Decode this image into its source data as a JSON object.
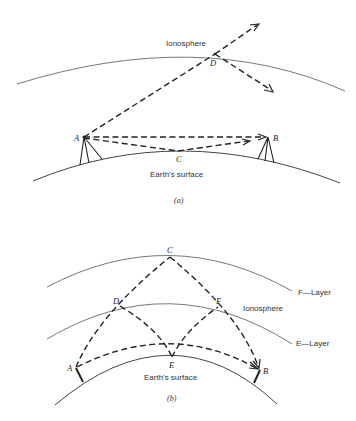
{
  "diagram_a": {
    "caption": "(a)",
    "layers": {
      "ionosphere": "Ionosphere",
      "earth": "Earth's surface"
    },
    "points": {
      "A": "A",
      "B": "B",
      "C": "C",
      "D": "D"
    },
    "description": "Sky wave penetrating the ionosphere at D vs. direct and ground-reflected waves from A to B via C"
  },
  "diagram_b": {
    "caption": "(b)",
    "layers": {
      "f_layer": "F—Layer",
      "ionosphere": "Ionosphere",
      "e_layer": "E—Layer",
      "earth": "Earth's surface"
    },
    "points": {
      "A": "A",
      "B": "B",
      "C": "C",
      "D": "D",
      "E": "E",
      "F": "F"
    },
    "description": "Multi-hop propagation: A→C→B via F-layer, A→D→E→F→B via E-layer, and ground wave A→B"
  }
}
